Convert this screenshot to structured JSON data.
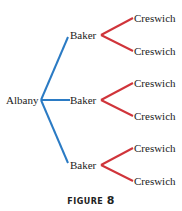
{
  "diagram": {
    "type": "tree-diagram",
    "root": {
      "label": "Albany"
    },
    "level1": [
      {
        "label": "Baker",
        "children": [
          {
            "label": "Creswich"
          },
          {
            "label": "Creswich"
          }
        ]
      },
      {
        "label": "Baker",
        "children": [
          {
            "label": "Creswich"
          },
          {
            "label": "Creswich"
          }
        ]
      },
      {
        "label": "Baker",
        "children": [
          {
            "label": "Creswich"
          },
          {
            "label": "Creswich"
          }
        ]
      }
    ],
    "colors": {
      "level1_edges": "#2b7bc4",
      "level2_edges": "#d0343a",
      "text": "#222222"
    }
  },
  "caption": {
    "prefix": "FIGURE",
    "number": "8"
  }
}
